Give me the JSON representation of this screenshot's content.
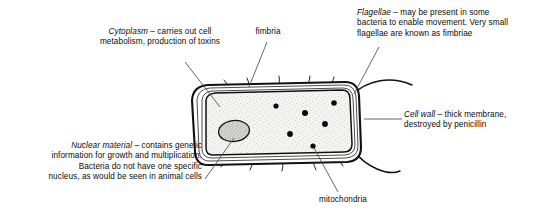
{
  "figure": {
    "background_color": "#ffffff",
    "ink_color": "#111111",
    "cytoplasm_fill": "#f2f2f0",
    "nucleus_fill": "#cfcfcb"
  },
  "annotations": {
    "cytoplasm": {
      "term": "Cytoplasm",
      "text": " – carries out cell\nmetabolism, production of toxins",
      "align": "center"
    },
    "fimbria": {
      "term": "",
      "text": "fimbria",
      "align": "center"
    },
    "flagellae": {
      "term": "Flagellae",
      "text": " – may be present in some\nbacteria to enable movement. Very small\nflagellae are known as fimbriae",
      "align": "left"
    },
    "cell_wall": {
      "term": "Cell wall",
      "text": " – thick membrane,\ndestroyed by penicillin",
      "align": "left"
    },
    "nuclear_material": {
      "term": "Nuclear material",
      "text": " – contains genetic\ninformation for growth and multiplication.\nBacteria do not have one specific\nnucleus, as would be seen in animal cells",
      "align": "right"
    },
    "mitochondria": {
      "term": "",
      "text": "mitochondria",
      "align": "center"
    }
  },
  "structures": {
    "cell_body_label": "bacterial-cell-outline",
    "cell_wall_label": "cell-wall-layers",
    "cytoplasm_label": "cytoplasm-region",
    "nucleus_label": "nuclear-material-blob",
    "mitochondria_dots": 6,
    "fimbriae_count": 9,
    "flagellae_count": 2
  },
  "leader_lines": [
    {
      "name": "leader-cytoplasm",
      "from": [
        185,
        62
      ],
      "to": [
        218,
        104
      ]
    },
    {
      "name": "leader-fimbria",
      "from": [
        267,
        41
      ],
      "to": [
        249,
        88
      ]
    },
    {
      "name": "leader-flagellae",
      "from": [
        379,
        46
      ],
      "to": [
        353,
        95
      ]
    },
    {
      "name": "leader-cell-wall",
      "from": [
        402,
        119
      ],
      "to": [
        366,
        119
      ]
    },
    {
      "name": "leader-nuclear",
      "from": [
        204,
        178
      ],
      "to": [
        234,
        137
      ]
    },
    {
      "name": "leader-mitochondria",
      "from": [
        338,
        193
      ],
      "to": [
        313,
        147
      ]
    }
  ]
}
